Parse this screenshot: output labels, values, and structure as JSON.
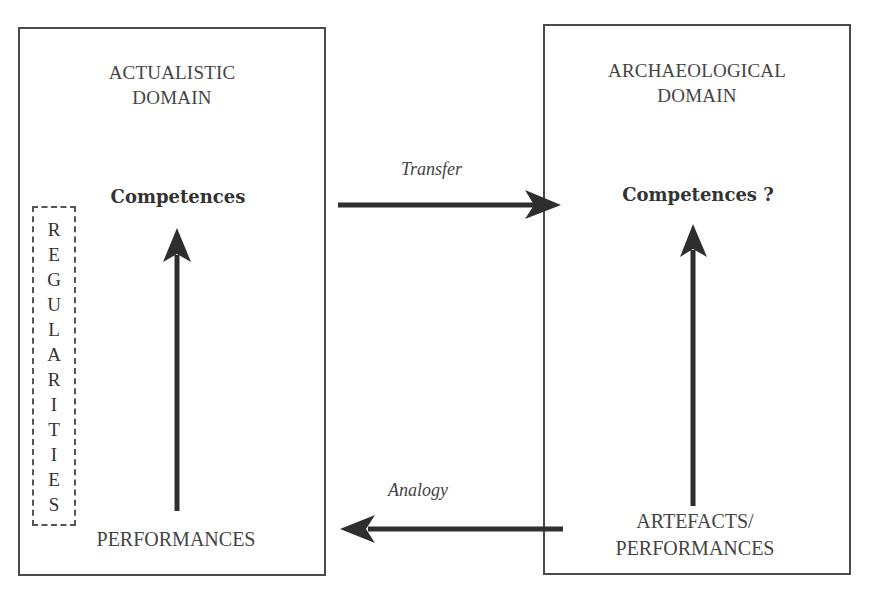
{
  "diagram": {
    "left_domain": {
      "title_lines": [
        "ACTUALISTIC",
        "DOMAIN"
      ],
      "top_node": "Competences",
      "bottom_node_lines": [
        "PERFORMANCES"
      ],
      "side_label_letters": [
        "R",
        "E",
        "G",
        "U",
        "L",
        "A",
        "R",
        "I",
        "T",
        "I",
        "E",
        "S"
      ],
      "side_label": "REGULARITIES"
    },
    "right_domain": {
      "title_lines": [
        "ARCHAEOLOGICAL",
        "DOMAIN"
      ],
      "top_node": "Competences ?",
      "bottom_node_lines": [
        "ARTEFACTS/",
        "PERFORMANCES"
      ]
    },
    "connections": {
      "transfer": {
        "label": "Transfer",
        "from": "left_domain.top_node",
        "to": "right_domain.top_node"
      },
      "analogy": {
        "label": "Analogy",
        "from": "right_domain.bottom_node",
        "to": "left_domain.bottom_node"
      },
      "left_vertical": {
        "from": "PERFORMANCES",
        "to": "Competences"
      },
      "right_vertical": {
        "from": "ARTEFACTS/PERFORMANCES",
        "to": "Competences ?"
      }
    },
    "colors": {
      "stroke": "#4a4a4a",
      "arrow": "#2e2e2e",
      "text": "#3a3a3a",
      "background": "#ffffff"
    }
  }
}
